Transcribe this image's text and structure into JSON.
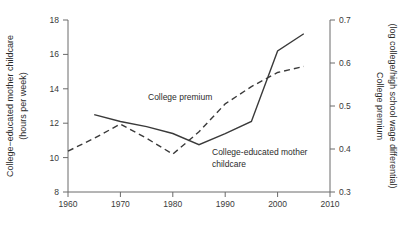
{
  "chart_data": {
    "type": "line",
    "title": "",
    "xlabel": "",
    "ylabel": "College−educated mother childcare (hours per week)",
    "y2label": "College premium (log college/high school wage differential)",
    "xlim": [
      1958,
      2012
    ],
    "ylim": [
      8,
      18
    ],
    "y2lim": [
      0.3,
      0.7
    ],
    "grid": false,
    "legend_position": "inline-annotations",
    "xticks": [
      "1960",
      "1970",
      "1980",
      "1990",
      "2000",
      "2010"
    ],
    "xtick_values": [
      1960,
      1970,
      1980,
      1990,
      2000,
      2010
    ],
    "yticks": [
      "8",
      "10",
      "12",
      "14",
      "16",
      "18"
    ],
    "ytick_values": [
      8,
      10,
      12,
      14,
      16,
      18
    ],
    "y2ticks": [
      "0.3",
      "0.4",
      "0.5",
      "0.6",
      "0.7"
    ],
    "y2tick_values": [
      0.3,
      0.4,
      0.5,
      0.6,
      0.7
    ],
    "series": [
      {
        "name": "College-educated mother childcare",
        "style": "solid",
        "axis": "left",
        "units": "hours per week",
        "x": [
          1965,
          1970,
          1975,
          1980,
          1985,
          1990,
          1995,
          2000,
          2005
        ],
        "values": [
          12.5,
          12.1,
          11.8,
          11.4,
          10.75,
          11.4,
          12.1,
          16.2,
          17.2
        ]
      },
      {
        "name": "College premium",
        "style": "dashed",
        "axis": "right",
        "units": "log college/high school wage differential",
        "x": [
          1960,
          1965,
          1970,
          1975,
          1980,
          1985,
          1990,
          1995,
          2000,
          2005
        ],
        "values": [
          0.395,
          0.425,
          0.458,
          0.425,
          0.388,
          0.44,
          0.505,
          0.545,
          0.578,
          0.592
        ]
      }
    ],
    "annotations": [
      {
        "id": "college-premium-label",
        "text": "College premium",
        "x_px": 148,
        "y_px": 100
      },
      {
        "id": "childcare-label-line1",
        "text": "College-educated mother",
        "x_px": 212,
        "y_px": 155
      },
      {
        "id": "childcare-label-line2",
        "text": "childcare",
        "x_px": 212,
        "y_px": 167
      }
    ],
    "colors": {
      "line": "#3a3a3a",
      "axis": "#6a6a6a",
      "text": "#2b2b2b",
      "background": "#ffffff"
    }
  }
}
